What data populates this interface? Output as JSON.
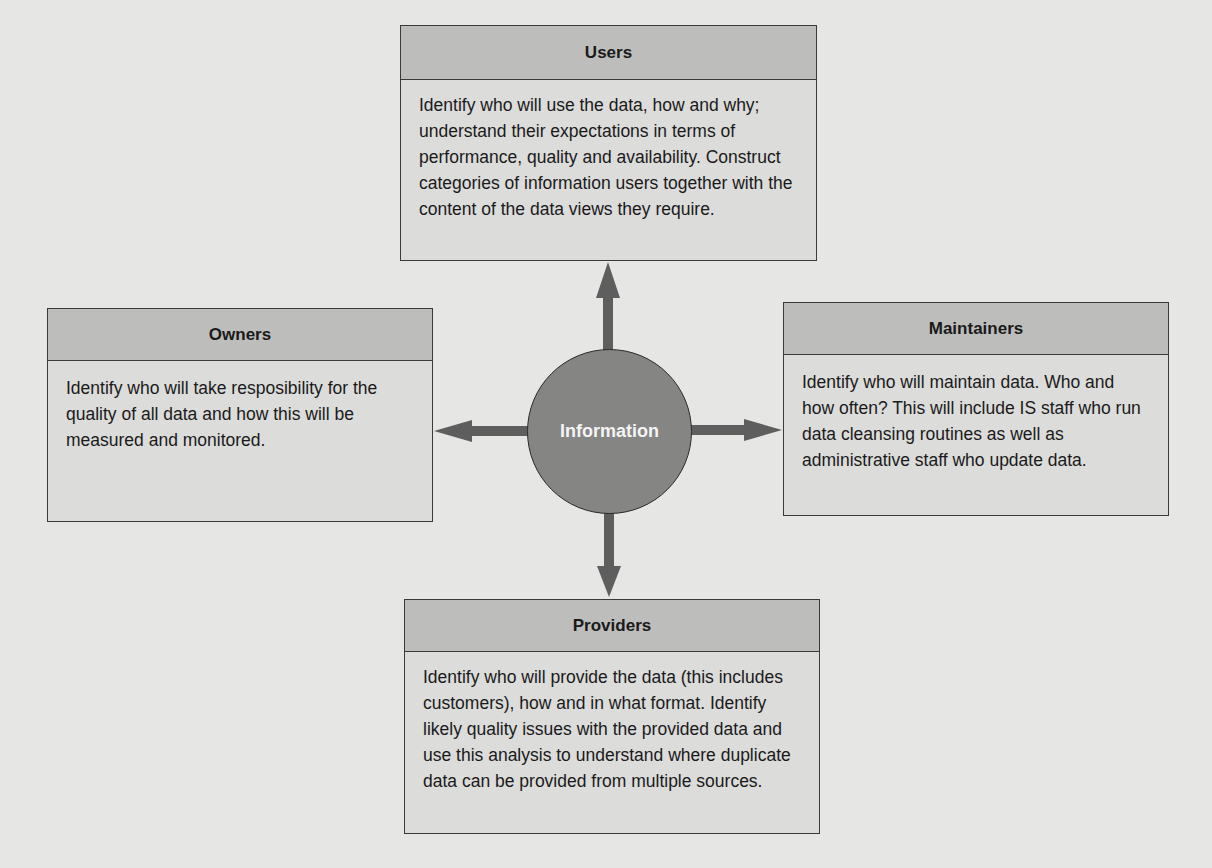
{
  "diagram": {
    "center": {
      "label": "Information"
    },
    "colors": {
      "background": "#e6e6e4",
      "box_fill": "#dcdcda",
      "header_fill": "#bdbdbb",
      "circle_fill": "#858584",
      "arrow": "#5e5e5e",
      "border": "#3a3a3a"
    },
    "boxes": {
      "users": {
        "title": "Users",
        "body": "Identify who will use the data, how and why; understand their expectations in terms of performance, quality and availability. Construct categories of information users together with the content of the data views they require."
      },
      "owners": {
        "title": "Owners",
        "body": "Identify who will take resposibility for the quality of all data and how this will be measured and monitored."
      },
      "maintainers": {
        "title": "Maintainers",
        "body": "Identify who will maintain data. Who and how often? This will include IS staff who run data cleansing routines as well as administrative staff who update data."
      },
      "providers": {
        "title": "Providers",
        "body": "Identify who will provide the data (this includes customers), how and in what format. Identify likely quality issues with the provided data and use this analysis to understand where duplicate data can be provided from multiple sources."
      }
    },
    "arrows": [
      {
        "from": "Information",
        "to": "Users",
        "direction": "up"
      },
      {
        "from": "Information",
        "to": "Owners",
        "direction": "left"
      },
      {
        "from": "Information",
        "to": "Maintainers",
        "direction": "right"
      },
      {
        "from": "Information",
        "to": "Providers",
        "direction": "down"
      }
    ]
  }
}
